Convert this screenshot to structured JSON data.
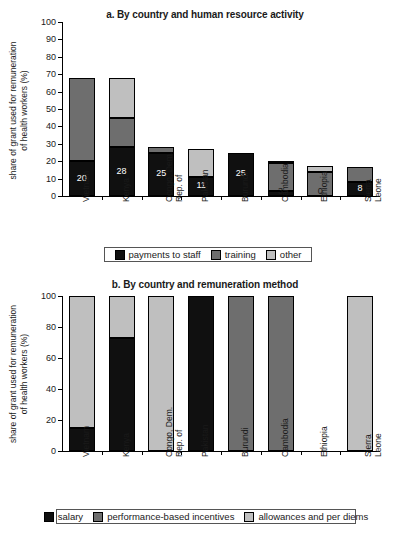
{
  "colors": {
    "payments_to_staff": "#101010",
    "training": "#6e6e6e",
    "other": "#bfbfbf",
    "salary": "#101010",
    "performance_based_incentives": "#6e6e6e",
    "allowances_and_per_diems": "#bfbfbf",
    "axis": "#000000",
    "background": "#ffffff"
  },
  "panel_a": {
    "title": "a. By country and human resource activity",
    "ylabel_line1": "share of grant used for remuneration",
    "ylabel_line2": "of health workers (%)",
    "yticks": [
      "0",
      "10",
      "20",
      "30",
      "40",
      "50",
      "60",
      "70",
      "80",
      "90",
      "100"
    ],
    "categories": [
      {
        "line1": "Vietnam",
        "line2": ""
      },
      {
        "line1": "Kenya",
        "line2": ""
      },
      {
        "line1": "Congo, Dem.",
        "line2": "Rep. of"
      },
      {
        "line1": "Pakistan",
        "line2": ""
      },
      {
        "line1": "Burundi",
        "line2": ""
      },
      {
        "line1": "Cambodia",
        "line2": ""
      },
      {
        "line1": "Ethiopia",
        "line2": ""
      },
      {
        "line1": "Sierra",
        "line2": "Leone"
      }
    ],
    "bar_labels": [
      "20",
      "28",
      "25",
      "11",
      "25",
      "3",
      "0",
      "8"
    ],
    "legend": [
      {
        "label": "payments to staff",
        "color_key": "payments_to_staff"
      },
      {
        "label": "training",
        "color_key": "training"
      },
      {
        "label": "other",
        "color_key": "other"
      }
    ]
  },
  "panel_b": {
    "title": "b. By country and remuneration method",
    "ylabel_line1": "share of grant used for remuneration",
    "ylabel_line2": "of health workers (%)",
    "yticks": [
      "0",
      "20",
      "40",
      "60",
      "80",
      "100"
    ],
    "categories": [
      {
        "line1": "Vietnam",
        "line2": ""
      },
      {
        "line1": "Kenya",
        "line2": ""
      },
      {
        "line1": "Congo, Dem.",
        "line2": "Rep. of"
      },
      {
        "line1": "Pakistan",
        "line2": ""
      },
      {
        "line1": "Burundi",
        "line2": ""
      },
      {
        "line1": "Cambodia",
        "line2": ""
      },
      {
        "line1": "Ethiopia",
        "line2": ""
      },
      {
        "line1": "Sierra",
        "line2": "Leone"
      }
    ],
    "legend": [
      {
        "label": "salary",
        "color_key": "salary"
      },
      {
        "label": "performance-based incentives",
        "color_key": "performance_based_incentives"
      },
      {
        "label": "allowances and per diems",
        "color_key": "allowances_and_per_diems"
      }
    ]
  },
  "chart_data": [
    {
      "type": "bar",
      "stacked": true,
      "title": "a. By country and human resource activity",
      "xlabel": "",
      "ylabel": "share of grant used for remuneration of health workers (%)",
      "ylim": [
        0,
        100
      ],
      "ytick_step": 10,
      "grid": false,
      "legend_position": "bottom",
      "categories": [
        "Vietnam",
        "Kenya",
        "Congo, Dem. Rep. of",
        "Pakistan",
        "Burundi",
        "Cambodia",
        "Ethiopia",
        "Sierra Leone"
      ],
      "series": [
        {
          "name": "payments to staff",
          "color": "#101010",
          "values": [
            20,
            28,
            25,
            11,
            25,
            3,
            0,
            8
          ]
        },
        {
          "name": "training",
          "color": "#6e6e6e",
          "values": [
            48,
            17,
            3,
            0,
            0,
            16,
            14,
            8.5
          ]
        },
        {
          "name": "other",
          "color": "#bfbfbf",
          "values": [
            0,
            23,
            0,
            16,
            0,
            1,
            3,
            0
          ]
        }
      ],
      "totals": [
        68,
        68,
        28,
        27,
        25,
        20,
        17,
        16.5
      ],
      "data_labels": [
        20,
        28,
        25,
        11,
        25,
        3,
        0,
        8
      ]
    },
    {
      "type": "bar",
      "stacked": true,
      "title": "b. By country and remuneration method",
      "xlabel": "",
      "ylabel": "share of grant used for remuneration of health workers (%)",
      "ylim": [
        0,
        100
      ],
      "ytick_step": 20,
      "grid": false,
      "legend_position": "bottom",
      "categories": [
        "Vietnam",
        "Kenya",
        "Congo, Dem. Rep. of",
        "Pakistan",
        "Burundi",
        "Cambodia",
        "Ethiopia",
        "Sierra Leone"
      ],
      "series": [
        {
          "name": "salary",
          "color": "#101010",
          "values": [
            15,
            73,
            0,
            100,
            0,
            0,
            0,
            0
          ]
        },
        {
          "name": "performance-based incentives",
          "color": "#6e6e6e",
          "values": [
            0,
            0,
            0,
            0,
            100,
            100,
            0,
            0
          ]
        },
        {
          "name": "allowances and per diems",
          "color": "#bfbfbf",
          "values": [
            85,
            27,
            100,
            0,
            0,
            0,
            0,
            100
          ]
        }
      ],
      "totals": [
        100,
        100,
        100,
        100,
        100,
        100,
        0,
        100
      ]
    }
  ]
}
